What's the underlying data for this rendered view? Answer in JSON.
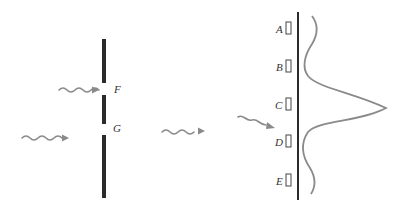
{
  "diagram": {
    "slits": [
      {
        "label": "F"
      },
      {
        "label": "G"
      }
    ],
    "detectors": [
      {
        "label": "A"
      },
      {
        "label": "B"
      },
      {
        "label": "C"
      },
      {
        "label": "D"
      },
      {
        "label": "E"
      }
    ],
    "intensity_profile": "central maximum at C, minima near B and D",
    "colors": {
      "barrier": "#2b2b2b",
      "wave": "#8a8a8a",
      "curve": "#8a8a8a"
    }
  }
}
